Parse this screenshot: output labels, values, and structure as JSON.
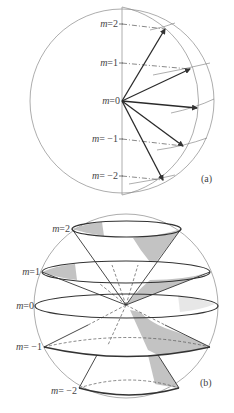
{
  "figure_a": {
    "caption": "(a)",
    "labels": [
      {
        "m": "m = 2",
        "text_m": "m",
        "text_eq": "=2"
      },
      {
        "m": "m = 1",
        "text_m": "m",
        "text_eq": "=1"
      },
      {
        "m": "m = 0",
        "text_m": "m",
        "text_eq": "=0"
      },
      {
        "m": "m = -1",
        "text_m": "m",
        "text_eq": "= −1"
      },
      {
        "m": "m = -2",
        "text_m": "m",
        "text_eq": "= −2"
      }
    ]
  },
  "figure_b": {
    "caption": "(b)",
    "labels": [
      {
        "m": "m = 2",
        "text_m": "m",
        "text_eq": "=2"
      },
      {
        "m": "m = 1",
        "text_m": "m",
        "text_eq": "=1"
      },
      {
        "m": "m = 0",
        "text_m": "m",
        "text_eq": "=0"
      },
      {
        "m": "m = -1",
        "text_m": "m",
        "text_eq": "= −1"
      },
      {
        "m": "m = -2",
        "text_m": "m",
        "text_eq": "= −2"
      }
    ]
  },
  "colors": {
    "line": "#555555",
    "thin_line": "#888888",
    "shade": "#b8b8b8",
    "text": "#444444"
  }
}
